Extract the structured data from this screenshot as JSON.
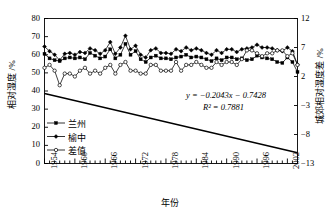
{
  "chart_data": {
    "type": "line",
    "title": "",
    "xlabel": "年份",
    "ylabel": "相对湿度 /%",
    "y2label": "城郊相对湿度差 /%",
    "xlim": [
      1954,
      2004
    ],
    "ylim": [
      0,
      80
    ],
    "y2lim": [
      -13,
      12
    ],
    "grid": false,
    "legend_position": "lower-left-inside",
    "y_ticks": [
      "0",
      "10",
      "20",
      "30",
      "40",
      "50",
      "60",
      "70",
      "80"
    ],
    "y2_ticks": [
      "-13",
      "-8",
      "-3",
      "2",
      "7",
      "12"
    ],
    "x_ticks": [
      "1954",
      "1960",
      "1966",
      "1972",
      "1978",
      "1984",
      "1990",
      "1996",
      "2002"
    ],
    "x_tick_step_minor": 1,
    "annotations": [
      {
        "name": "trend-equation",
        "text": "y = −0.2043x − 0.7428"
      },
      {
        "name": "trend-r2",
        "text": "R² = 0.7881"
      }
    ],
    "x": [
      1954,
      1955,
      1956,
      1957,
      1958,
      1959,
      1960,
      1961,
      1962,
      1963,
      1964,
      1965,
      1966,
      1967,
      1968,
      1969,
      1970,
      1971,
      1972,
      1973,
      1974,
      1975,
      1976,
      1977,
      1978,
      1979,
      1980,
      1981,
      1982,
      1983,
      1984,
      1985,
      1986,
      1987,
      1988,
      1989,
      1990,
      1991,
      1992,
      1993,
      1994,
      1995,
      1996,
      1997,
      1998,
      1999,
      2000,
      2001,
      2002,
      2003,
      2004
    ],
    "series": [
      {
        "name": "兰州",
        "marker": "filled-square",
        "axis": "left",
        "values": [
          60.5,
          58.0,
          57.0,
          56.5,
          58.0,
          58.5,
          58.0,
          58.5,
          57.5,
          61.0,
          59.5,
          58.0,
          59.0,
          63.0,
          58.0,
          60.0,
          66.0,
          60.0,
          62.0,
          57.5,
          56.0,
          58.5,
          59.5,
          58.0,
          58.0,
          57.5,
          58.5,
          59.0,
          60.0,
          58.5,
          59.0,
          58.5,
          57.5,
          56.5,
          58.0,
          57.0,
          58.5,
          58.5,
          57.5,
          58.0,
          57.0,
          57.5,
          59.5,
          58.5,
          58.0,
          57.5,
          56.0,
          55.5,
          58.5,
          56.0,
          50.5
        ]
      },
      {
        "name": "榆中",
        "marker": "filled-diamond",
        "axis": "left",
        "values": [
          64.5,
          62.0,
          60.0,
          57.0,
          60.5,
          61.0,
          60.0,
          61.5,
          61.0,
          63.5,
          62.5,
          60.5,
          62.5,
          67.0,
          60.5,
          64.0,
          70.5,
          63.0,
          65.0,
          60.0,
          58.5,
          62.5,
          63.5,
          61.0,
          61.0,
          60.5,
          63.0,
          62.0,
          64.0,
          62.5,
          63.5,
          62.5,
          61.0,
          60.0,
          62.5,
          61.0,
          63.0,
          63.0,
          61.5,
          63.0,
          63.5,
          64.0,
          65.5,
          64.0,
          64.0,
          63.5,
          62.5,
          62.0,
          64.0,
          62.0,
          54.5
        ]
      },
      {
        "name": "差值",
        "marker": "open-circle",
        "axis": "right",
        "values": [
          3.5,
          4.0,
          3.0,
          0.5,
          2.5,
          2.5,
          2.0,
          3.0,
          3.5,
          2.5,
          3.0,
          2.5,
          3.5,
          4.0,
          2.5,
          4.0,
          4.5,
          3.0,
          3.0,
          2.5,
          2.5,
          4.0,
          4.0,
          3.0,
          3.0,
          3.0,
          4.5,
          3.0,
          4.0,
          4.0,
          4.5,
          4.0,
          3.5,
          3.5,
          4.5,
          4.0,
          4.5,
          4.5,
          4.0,
          5.0,
          6.5,
          6.5,
          6.0,
          5.5,
          6.0,
          6.0,
          6.5,
          6.5,
          5.5,
          6.0,
          4.0
        ]
      }
    ],
    "trendline": {
      "name": "linear-trend-difference",
      "slope": -0.2043,
      "intercept": -0.7428,
      "r_squared": 0.7881,
      "axis": "right"
    }
  },
  "legend": {
    "items": [
      {
        "label": "兰州",
        "marker": "filled-square"
      },
      {
        "label": "榆中",
        "marker": "filled-diamond"
      },
      {
        "label": "差值",
        "marker": "open-circle"
      }
    ]
  },
  "colors": {
    "line": "#000000",
    "background": "#ffffff",
    "axis": "#000000"
  }
}
